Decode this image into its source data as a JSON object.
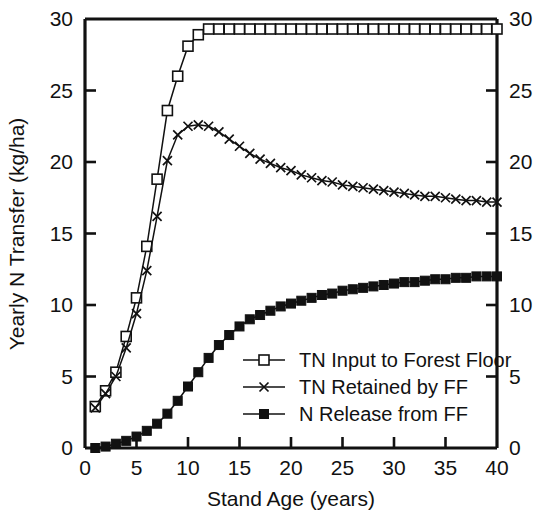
{
  "chart_data": {
    "type": "line",
    "title": "",
    "xlabel": "Stand Age (years)",
    "ylabel": "Yearly N Transfer (kg/ha)",
    "xlim": [
      0,
      40
    ],
    "ylim": [
      0,
      30
    ],
    "xticks": [
      0,
      5,
      10,
      15,
      20,
      25,
      30,
      35,
      40
    ],
    "yticks": [
      0,
      5,
      10,
      15,
      20,
      25,
      30
    ],
    "xtick_labels": [
      "0",
      "5",
      "10",
      "15",
      "20",
      "25",
      "30",
      "35",
      "40"
    ],
    "ytick_labels": [
      "0",
      "5",
      "10",
      "15",
      "20",
      "25",
      "30"
    ],
    "right_axis_ticks": [
      0,
      5,
      10,
      15,
      20,
      25,
      30
    ],
    "right_axis_tick_labels": [
      "0",
      "5",
      "10",
      "15",
      "20",
      "25",
      "30"
    ],
    "grid": false,
    "legend_position": "inside-lower-right",
    "x": [
      1,
      2,
      3,
      4,
      5,
      6,
      7,
      8,
      9,
      10,
      11,
      12,
      13,
      14,
      15,
      16,
      17,
      18,
      19,
      20,
      21,
      22,
      23,
      24,
      25,
      26,
      27,
      28,
      29,
      30,
      31,
      32,
      33,
      34,
      35,
      36,
      37,
      38,
      39,
      40
    ],
    "series": [
      {
        "name": "TN Input to Forest Floor",
        "marker": "open-square",
        "values": [
          2.9,
          4.0,
          5.3,
          7.8,
          10.5,
          14.1,
          18.8,
          23.6,
          26.0,
          28.1,
          28.9,
          29.3,
          29.3,
          29.3,
          29.3,
          29.3,
          29.3,
          29.3,
          29.3,
          29.3,
          29.3,
          29.3,
          29.3,
          29.3,
          29.3,
          29.3,
          29.3,
          29.3,
          29.3,
          29.3,
          29.3,
          29.3,
          29.3,
          29.3,
          29.3,
          29.3,
          29.3,
          29.3,
          29.3,
          29.3
        ]
      },
      {
        "name": "TN Retained by FF",
        "marker": "cross",
        "values": [
          2.8,
          3.8,
          5.0,
          7.0,
          9.4,
          12.4,
          16.2,
          20.1,
          21.9,
          22.5,
          22.6,
          22.5,
          22.1,
          21.6,
          21.1,
          20.6,
          20.2,
          19.9,
          19.6,
          19.4,
          19.1,
          18.9,
          18.7,
          18.6,
          18.4,
          18.3,
          18.2,
          18.1,
          18.0,
          17.9,
          17.8,
          17.7,
          17.6,
          17.6,
          17.5,
          17.4,
          17.3,
          17.3,
          17.2,
          17.2
        ]
      },
      {
        "name": "N Release from FF",
        "marker": "filled-square",
        "values": [
          0.0,
          0.1,
          0.3,
          0.5,
          0.8,
          1.2,
          1.7,
          2.4,
          3.3,
          4.3,
          5.3,
          6.3,
          7.2,
          7.9,
          8.5,
          9.0,
          9.3,
          9.6,
          9.9,
          10.1,
          10.3,
          10.5,
          10.7,
          10.8,
          11.0,
          11.1,
          11.2,
          11.3,
          11.4,
          11.5,
          11.6,
          11.6,
          11.7,
          11.8,
          11.8,
          11.9,
          11.9,
          12.0,
          12.0,
          12.0
        ]
      }
    ]
  },
  "legend": {
    "entries": [
      {
        "label": "TN Input to Forest Floor",
        "marker": "open-square"
      },
      {
        "label": "TN Retained by FF",
        "marker": "cross"
      },
      {
        "label": "N Release from FF",
        "marker": "filled-square"
      }
    ]
  },
  "axes": {
    "x_title": "Stand Age (years)",
    "y_title": "Yearly N Transfer (kg/ha)"
  }
}
